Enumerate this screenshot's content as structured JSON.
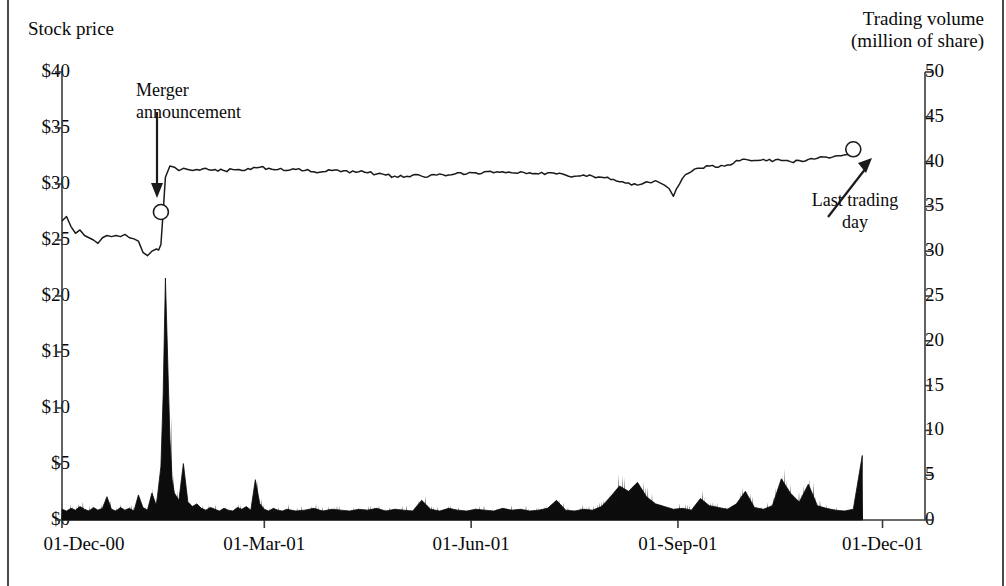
{
  "titles": {
    "left_axis": "Stock price",
    "right_axis": "Trading volume\n(million of share)"
  },
  "annotations": {
    "merger": "Merger\nannouncement",
    "last_trading_day": "Last trading\nday"
  },
  "axes": {
    "left_ticks": [
      "$40",
      "$35",
      "$30",
      "$25",
      "$20",
      "$15",
      "$10",
      "$5",
      "$0"
    ],
    "right_ticks": [
      "50",
      "45",
      "40",
      "35",
      "30",
      "25",
      "20",
      "15",
      "10",
      "5",
      "0"
    ],
    "x_ticks": [
      "01-Dec-00",
      "01-Mar-01",
      "01-Jun-01",
      "01-Sep-01",
      "01-Dec-01"
    ]
  },
  "colors": {
    "line": "#1a1a1a",
    "area": "#0d0d0d",
    "axis": "#3a3a3a",
    "background": "#ffffff"
  },
  "chart_data": {
    "type": "line",
    "title": "",
    "xlabel": "",
    "ylabel": "Stock price",
    "y2label": "Trading volume (million of share)",
    "ylim": [
      0,
      40
    ],
    "y2lim": [
      0,
      50
    ],
    "grid": false,
    "legend": "none",
    "x_tick_labels": [
      "01-Dec-00",
      "01-Mar-01",
      "01-Jun-01",
      "01-Sep-01",
      "01-Dec-01"
    ],
    "x_tick_positions": [
      0,
      90,
      182,
      274,
      365
    ],
    "x_range": [
      0,
      375
    ],
    "markers": [
      {
        "name": "Merger announcement",
        "x": 44,
        "y_price": 27.5,
        "style": "open-circle"
      },
      {
        "name": "Last trading day",
        "x": 352,
        "y_price": 33.1,
        "style": "open-circle"
      }
    ],
    "series": [
      {
        "name": "Stock price",
        "axis": "left",
        "units": "USD",
        "x": [
          0,
          2,
          4,
          6,
          8,
          10,
          12,
          14,
          16,
          18,
          20,
          22,
          24,
          26,
          28,
          30,
          32,
          34,
          36,
          38,
          40,
          42,
          43,
          44,
          45,
          46,
          48,
          50,
          52,
          54,
          56,
          58,
          60,
          64,
          68,
          72,
          76,
          80,
          84,
          88,
          92,
          96,
          100,
          104,
          108,
          112,
          116,
          120,
          124,
          128,
          132,
          136,
          140,
          144,
          148,
          152,
          156,
          160,
          164,
          168,
          172,
          176,
          180,
          184,
          188,
          192,
          196,
          200,
          204,
          208,
          212,
          216,
          220,
          224,
          228,
          232,
          236,
          240,
          244,
          248,
          252,
          256,
          258,
          260,
          262,
          264,
          266,
          268,
          270,
          272,
          276,
          280,
          284,
          288,
          292,
          296,
          300,
          304,
          308,
          312,
          316,
          320,
          324,
          328,
          332,
          336,
          340,
          344,
          348,
          352
        ],
        "values": [
          26.7,
          27.1,
          26.2,
          25.6,
          25.9,
          25.4,
          25.2,
          25.0,
          24.7,
          25.2,
          25.4,
          25.3,
          25.4,
          25.3,
          25.5,
          25.2,
          25.1,
          24.9,
          23.9,
          23.6,
          24.0,
          24.2,
          24.1,
          24.6,
          27.5,
          30.6,
          31.6,
          31.5,
          31.2,
          31.4,
          31.3,
          31.2,
          31.3,
          31.4,
          31.3,
          31.2,
          31.3,
          31.2,
          31.3,
          31.5,
          31.4,
          31.3,
          31.2,
          31.3,
          31.2,
          31.1,
          31.1,
          31.2,
          31.1,
          31.0,
          31.1,
          31.0,
          30.9,
          30.8,
          30.7,
          30.6,
          30.8,
          30.7,
          30.8,
          30.9,
          30.8,
          31.0,
          30.9,
          31.0,
          31.1,
          31.0,
          31.1,
          31.0,
          31.1,
          31.0,
          30.9,
          31.0,
          30.9,
          30.8,
          30.7,
          30.8,
          30.7,
          30.6,
          30.4,
          30.2,
          30.1,
          29.9,
          30.0,
          30.2,
          30.1,
          30.3,
          30.1,
          29.9,
          29.6,
          28.9,
          30.5,
          31.1,
          31.4,
          31.6,
          31.5,
          31.7,
          32.1,
          32.2,
          32.1,
          32.2,
          32.0,
          32.1,
          32.0,
          32.1,
          32.2,
          32.3,
          32.4,
          32.5,
          32.6,
          32.7
        ]
      },
      {
        "name": "Trading volume",
        "axis": "right",
        "units": "million of shares",
        "x": [
          0,
          2,
          4,
          6,
          8,
          10,
          12,
          14,
          16,
          18,
          20,
          22,
          24,
          26,
          28,
          30,
          32,
          34,
          36,
          38,
          40,
          42,
          44,
          45,
          46,
          47,
          48,
          49,
          50,
          52,
          54,
          56,
          58,
          60,
          62,
          64,
          66,
          68,
          70,
          72,
          74,
          76,
          78,
          80,
          82,
          84,
          86,
          88,
          90,
          92,
          94,
          96,
          98,
          100,
          104,
          108,
          112,
          116,
          120,
          124,
          128,
          132,
          136,
          140,
          144,
          148,
          152,
          156,
          160,
          164,
          168,
          172,
          176,
          180,
          184,
          188,
          192,
          196,
          200,
          204,
          208,
          212,
          216,
          220,
          224,
          228,
          232,
          236,
          240,
          244,
          248,
          252,
          256,
          260,
          264,
          268,
          272,
          276,
          280,
          284,
          288,
          292,
          296,
          300,
          304,
          308,
          312,
          316,
          320,
          324,
          328,
          332,
          336,
          340,
          344,
          348,
          352,
          356
        ],
        "values": [
          1.2,
          1.0,
          1.3,
          1.1,
          1.5,
          1.2,
          1.0,
          1.4,
          1.1,
          1.3,
          2.6,
          1.2,
          1.0,
          1.4,
          1.1,
          1.3,
          1.0,
          2.8,
          1.4,
          1.1,
          3.0,
          1.6,
          6.0,
          14.0,
          27.0,
          18.0,
          9.0,
          4.5,
          3.0,
          2.2,
          6.3,
          2.0,
          1.5,
          1.8,
          1.3,
          1.1,
          1.4,
          1.2,
          1.0,
          1.3,
          1.1,
          1.0,
          1.4,
          1.2,
          1.5,
          1.1,
          4.5,
          1.8,
          1.2,
          1.0,
          1.3,
          1.1,
          1.0,
          1.2,
          1.0,
          1.1,
          1.3,
          1.0,
          1.2,
          1.1,
          1.0,
          1.2,
          1.1,
          1.3,
          1.0,
          1.2,
          1.1,
          1.0,
          2.2,
          1.2,
          1.0,
          1.3,
          1.1,
          1.0,
          1.2,
          1.1,
          1.0,
          1.3,
          1.1,
          1.2,
          1.0,
          1.1,
          1.3,
          2.2,
          1.1,
          1.0,
          1.2,
          1.1,
          1.5,
          2.6,
          3.8,
          3.2,
          4.2,
          2.6,
          1.8,
          1.5,
          1.2,
          1.3,
          1.1,
          2.4,
          1.6,
          1.4,
          1.2,
          1.8,
          3.2,
          1.4,
          1.2,
          1.6,
          4.6,
          3.0,
          2.0,
          4.0,
          1.6,
          1.3,
          1.1,
          1.0,
          1.2,
          7.2
        ]
      }
    ]
  }
}
